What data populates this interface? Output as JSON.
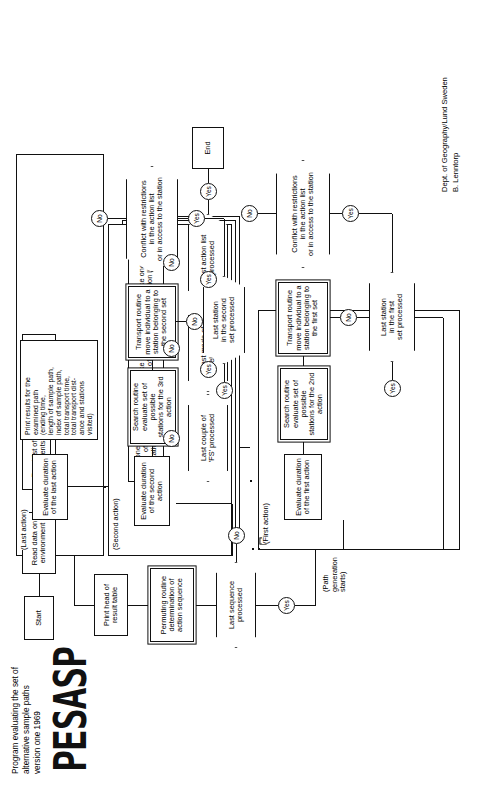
{
  "document": {
    "title": "Program evaluating the set of\nalternative sample paths\nversion one 1969",
    "logo": "PESASP",
    "credit": "Dept. of Geography/Lund Sweden\nB. Lenntorp"
  },
  "nodes": {
    "start": "Start",
    "read_environment": "Read data on\nenvironment",
    "read_coefficients": "Read list of\ncoefficients",
    "read_datagroups": "Read datagroups on\naction lists",
    "print_head": "Print head of\nresult table",
    "permuting": "Permuting routine\ndetermination of\naction sequence",
    "take_fs": "Take one couple of\nfixed stations (FS)",
    "take_mode": "Take one\nmode of travel",
    "take_action_list": "Take one\naction list",
    "end": "End"
  },
  "decisions": {
    "last_sequence": "Last sequence\nprocessed",
    "last_fs": "Last couple of\n'FS' processed",
    "last_mode": "Last mode of\ntravel processed",
    "last_action_list": "Last action list\nprocessed",
    "last_station_first": "Last station\nin the first\nset processed",
    "conflict_first": "Conflict with restrictions\nin the action list\nor in access to the station",
    "last_station_second": "Last station\nin the second\nset processed",
    "conflict_second": "Conflict with restrictions\nin the action list\nor in access to the station"
  },
  "first_action": {
    "label": "(First action)",
    "evaluate": "Evaluate duration\nof the first action",
    "search": "Search routine\nevaluate set of possible\nstations for the 2nd action",
    "transport": "Transport routine\nmove individual to a\nstation belonging to\nthe first set"
  },
  "second_action": {
    "label": "(Second action)",
    "evaluate": "Evaluate duration\nof the second action",
    "search": "Search routine\nevaluate set of possible\nstations for the 3rd action",
    "transport": "Transport routine\nmove individual to a\nstation belonging to\nthe second set"
  },
  "last_action": {
    "label": "(Last action)",
    "evaluate": "Evaluate duration\nof the last action",
    "print_results": "Print results for the\nexamined path\n(ending time,\nlength of sample path,\nindex of sample path,\ntotal transport time,\ntotal transport dist-\nance and stations\nvisited)"
  },
  "notes": {
    "path_generation": "(Path\ngeneration\nstarts)"
  },
  "branches": {
    "yes": "Yes",
    "no": "No"
  }
}
